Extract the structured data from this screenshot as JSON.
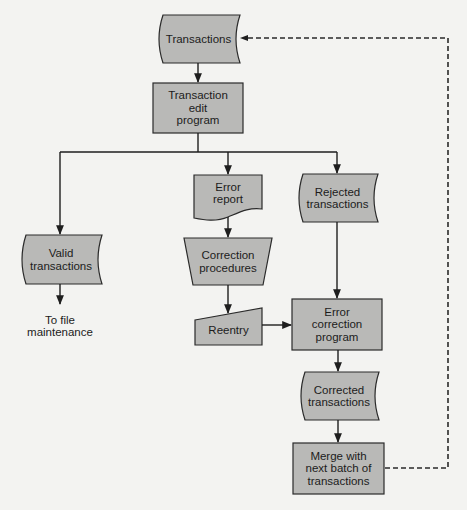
{
  "diagram": {
    "type": "flowchart",
    "colors": {
      "shape_fill": "#b9b9b7",
      "stroke": "#2a2a2a",
      "background": "#f3f3f1"
    },
    "nodes": {
      "transactions": {
        "shape": "stored-data",
        "lines": [
          "Transactions"
        ]
      },
      "edit_program": {
        "shape": "process",
        "lines": [
          "Transaction",
          "edit",
          "program"
        ]
      },
      "valid_transactions": {
        "shape": "stored-data",
        "lines": [
          "Valid",
          "transactions"
        ]
      },
      "file_maintenance": {
        "shape": "text",
        "lines": [
          "To file",
          "maintenance"
        ]
      },
      "error_report": {
        "shape": "document",
        "lines": [
          "Error",
          "report"
        ]
      },
      "correction_procedures": {
        "shape": "manual-operation",
        "lines": [
          "Correction",
          "procedures"
        ]
      },
      "reentry": {
        "shape": "manual-input",
        "lines": [
          "Reentry"
        ]
      },
      "rejected_transactions": {
        "shape": "stored-data",
        "lines": [
          "Rejected",
          "transactions"
        ]
      },
      "error_correction_program": {
        "shape": "process",
        "lines": [
          "Error",
          "correction",
          "program"
        ]
      },
      "corrected_transactions": {
        "shape": "stored-data",
        "lines": [
          "Corrected",
          "transactions"
        ]
      },
      "merge": {
        "shape": "process",
        "lines": [
          "Merge with",
          "next batch of",
          "transactions"
        ]
      }
    },
    "edges": [
      {
        "from": "transactions",
        "to": "edit_program",
        "style": "solid"
      },
      {
        "from": "edit_program",
        "to": "valid_transactions",
        "style": "solid"
      },
      {
        "from": "edit_program",
        "to": "error_report",
        "style": "solid"
      },
      {
        "from": "edit_program",
        "to": "rejected_transactions",
        "style": "solid"
      },
      {
        "from": "valid_transactions",
        "to": "file_maintenance",
        "style": "solid"
      },
      {
        "from": "error_report",
        "to": "correction_procedures",
        "style": "solid"
      },
      {
        "from": "correction_procedures",
        "to": "reentry",
        "style": "solid"
      },
      {
        "from": "reentry",
        "to": "error_correction_program",
        "style": "solid"
      },
      {
        "from": "rejected_transactions",
        "to": "error_correction_program",
        "style": "solid"
      },
      {
        "from": "error_correction_program",
        "to": "corrected_transactions",
        "style": "solid"
      },
      {
        "from": "corrected_transactions",
        "to": "merge",
        "style": "solid"
      },
      {
        "from": "merge",
        "to": "transactions",
        "style": "dashed"
      }
    ]
  }
}
